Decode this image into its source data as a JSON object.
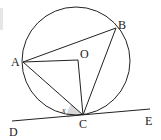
{
  "diagram": {
    "type": "circle-tangent-geometry",
    "points": {
      "A": {
        "label": "A",
        "x": 23,
        "y": 62
      },
      "B": {
        "label": "B",
        "x": 116,
        "y": 28
      },
      "C": {
        "label": "C",
        "x": 83,
        "y": 115
      },
      "O": {
        "label": "O",
        "x": 78,
        "y": 60
      },
      "D": {
        "label": "D",
        "x": 12,
        "y": 121
      },
      "E": {
        "label": "E",
        "x": 150,
        "y": 109
      }
    },
    "circle": {
      "center": "O",
      "cx": 76,
      "cy": 61,
      "r": 54
    },
    "segments": [
      "AB",
      "BC",
      "AC",
      "AO",
      "OC",
      "DE"
    ],
    "tangent_line": "DE",
    "angle_marker": {
      "label": "x",
      "at": "C",
      "between": [
        "CD",
        "CA"
      ],
      "fill": "#d9d9d9"
    },
    "colors": {
      "stroke": "#222222",
      "shade": "#d9d9d9",
      "background": "#ffffff"
    }
  }
}
